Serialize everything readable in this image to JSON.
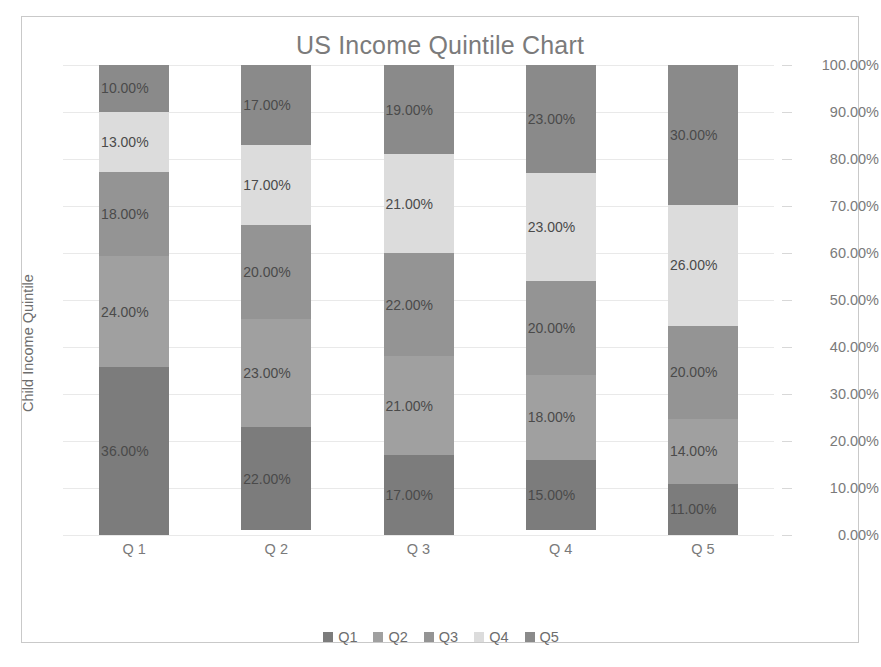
{
  "chart_data": {
    "type": "bar",
    "subtype": "stacked-column-100",
    "title": "US Income Quintile Chart",
    "xlabel": "",
    "ylabel": "Child Income Quintile",
    "categories": [
      "Q 1",
      "Q 2",
      "Q 3",
      "Q 4",
      "Q 5"
    ],
    "ylim": [
      0,
      100
    ],
    "ytick_labels": [
      "100.00%",
      "90.00%",
      "80.00%",
      "70.00%",
      "60.00%",
      "50.00%",
      "40.00%",
      "30.00%",
      "20.00%",
      "10.00%",
      "0.00%"
    ],
    "ytick_values": [
      100,
      90,
      80,
      70,
      60,
      50,
      40,
      30,
      20,
      10,
      0
    ],
    "y_axis_position": "right",
    "grid": true,
    "legend_position": "bottom",
    "stack_order": "bottom-to-top: Q1, Q2, Q3, Q4, Q5",
    "series": [
      {
        "name": "Q1",
        "color": "#7c7c7c",
        "values": [
          36,
          22,
          17,
          15,
          11
        ],
        "labels": [
          "36.00%",
          "22.00%",
          "17.00%",
          "15.00%",
          "11.00%"
        ]
      },
      {
        "name": "Q2",
        "color": "#a0a0a0",
        "values": [
          24,
          23,
          21,
          18,
          14
        ],
        "labels": [
          "24.00%",
          "23.00%",
          "21.00%",
          "18.00%",
          "14.00%"
        ]
      },
      {
        "name": "Q3",
        "color": "#949494",
        "values": [
          18,
          20,
          22,
          20,
          20
        ],
        "labels": [
          "18.00%",
          "20.00%",
          "22.00%",
          "20.00%",
          "20.00%"
        ]
      },
      {
        "name": "Q4",
        "color": "#dcdcdc",
        "values": [
          13,
          17,
          21,
          23,
          26
        ],
        "labels": [
          "13.00%",
          "17.00%",
          "21.00%",
          "23.00%",
          "26.00%"
        ]
      },
      {
        "name": "Q5",
        "color": "#8a8a8a",
        "values": [
          10,
          17,
          19,
          23,
          30
        ],
        "labels": [
          "10.00%",
          "17.00%",
          "19.00%",
          "23.00%",
          "30.00%"
        ]
      }
    ],
    "legend": [
      {
        "label": "Q1",
        "color": "#7c7c7c"
      },
      {
        "label": "Q2",
        "color": "#a0a0a0"
      },
      {
        "label": "Q3",
        "color": "#949494"
      },
      {
        "label": "Q4",
        "color": "#dcdcdc"
      },
      {
        "label": "Q5",
        "color": "#8a8a8a"
      }
    ]
  },
  "caption": ""
}
